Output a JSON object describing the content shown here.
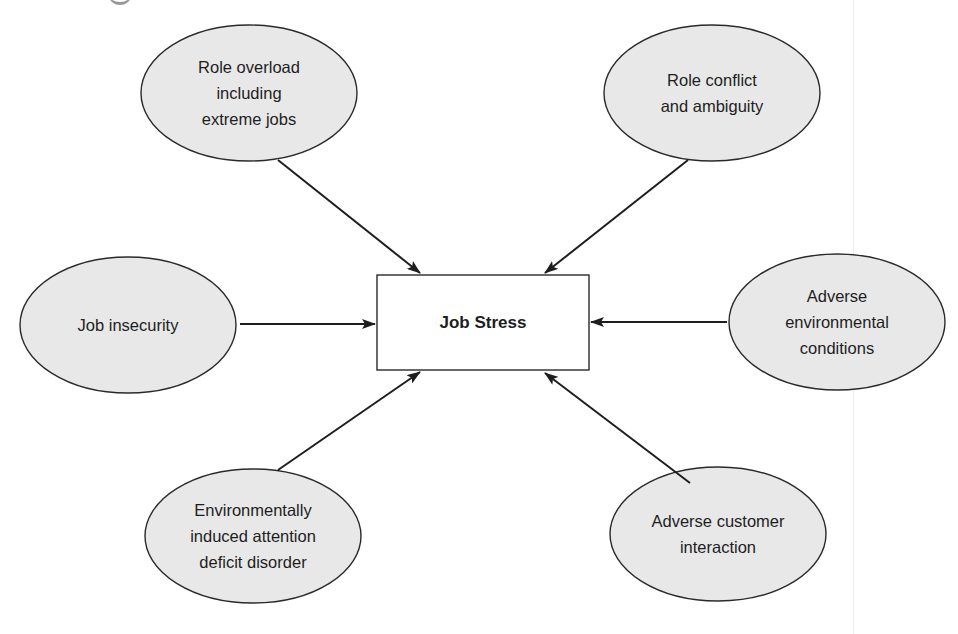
{
  "diagram": {
    "type": "hub-and-spoke causal diagram",
    "center": {
      "label": "Job Stress"
    },
    "nodes": [
      {
        "id": "role-overload",
        "label": "Role overload\nincluding\nextreme jobs",
        "cx": 249,
        "cy": 93
      },
      {
        "id": "role-conflict",
        "label": "Role conflict\nand ambiguity",
        "cx": 712,
        "cy": 93
      },
      {
        "id": "job-insecurity",
        "label": "Job insecurity",
        "cx": 128,
        "cy": 325
      },
      {
        "id": "adverse-environmental",
        "label": "Adverse\nenvironmental\nconditions",
        "cx": 837,
        "cy": 322
      },
      {
        "id": "eiadd",
        "label": "Environmentally\ninduced attention\ndeficit disorder",
        "cx": 253,
        "cy": 536
      },
      {
        "id": "adverse-customer",
        "label": "Adverse customer\ninteraction",
        "cx": 718,
        "cy": 534
      }
    ],
    "edges": [
      {
        "from": "role-overload",
        "to": "Job Stress"
      },
      {
        "from": "role-conflict",
        "to": "Job Stress"
      },
      {
        "from": "job-insecurity",
        "to": "Job Stress"
      },
      {
        "from": "adverse-environmental",
        "to": "Job Stress"
      },
      {
        "from": "eiadd",
        "to": "Job Stress"
      },
      {
        "from": "adverse-customer",
        "to": "Job Stress"
      }
    ],
    "colors": {
      "ellipse_fill": "#e8e8e8",
      "stroke": "#1e1e1e",
      "box_fill": "#ffffff"
    }
  }
}
